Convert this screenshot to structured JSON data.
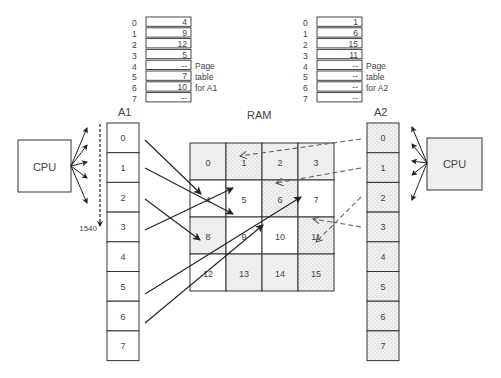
{
  "page_table_a1": {
    "indices": [
      "0",
      "1",
      "2",
      "3",
      "4",
      "5",
      "6",
      "7"
    ],
    "values": [
      "4",
      "9",
      "12",
      "5",
      "--",
      "7",
      "10",
      "--"
    ],
    "label_lines": [
      "Page",
      "table",
      "for A1"
    ]
  },
  "page_table_a2": {
    "indices": [
      "0",
      "1",
      "2",
      "3",
      "4",
      "5",
      "6",
      "7"
    ],
    "values": [
      "1",
      "6",
      "15",
      "11",
      "--",
      "--",
      "--",
      "--"
    ],
    "label_lines": [
      "Page",
      "table",
      "for A2"
    ]
  },
  "a1": {
    "label": "A1",
    "pages": [
      "0",
      "1",
      "2",
      "3",
      "4",
      "5",
      "6",
      "7"
    ],
    "address_label": "1540"
  },
  "a2": {
    "label": "A2",
    "pages": [
      "0",
      "1",
      "2",
      "3",
      "4",
      "5",
      "6",
      "7"
    ]
  },
  "ram": {
    "label": "RAM",
    "frames": [
      "0",
      "1",
      "2",
      "3",
      "4",
      "5",
      "6",
      "7",
      "8",
      "9",
      "10",
      "11",
      "12",
      "13",
      "14",
      "15"
    ]
  },
  "cpu_left": {
    "label": "CPU"
  },
  "cpu_right": {
    "label": "CPU"
  },
  "colors": {
    "line": "#333333",
    "gray_fill": "#eeeeee",
    "dotted_fill": "#e8e8e8",
    "white": "#ffffff"
  }
}
